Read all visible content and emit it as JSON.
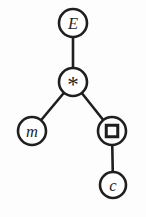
{
  "figure": {
    "background": "#fdfdfd",
    "stroke_color": "#1f1f1f",
    "node_fill": "#ffffff",
    "stroke_width": 2.6,
    "default_radius": 14,
    "width": 146,
    "height": 217,
    "nodes": [
      {
        "id": "E",
        "label": "E",
        "glyph": "letter",
        "x": 73,
        "y": 23
      },
      {
        "id": "star",
        "label": "*",
        "glyph": "asterisk",
        "x": 73,
        "y": 82
      },
      {
        "id": "m",
        "label": "m",
        "glyph": "letter",
        "x": 32,
        "y": 131
      },
      {
        "id": "box",
        "label": "",
        "glyph": "square",
        "icon": "square-icon",
        "x": 112,
        "y": 131,
        "square_size": 11.5,
        "square_stroke": 3
      },
      {
        "id": "c",
        "label": "c",
        "glyph": "letter",
        "x": 113,
        "y": 185,
        "r": 13
      }
    ],
    "edges": [
      {
        "from": "E",
        "to": "star"
      },
      {
        "from": "star",
        "to": "m"
      },
      {
        "from": "star",
        "to": "box"
      },
      {
        "from": "box",
        "to": "c"
      }
    ]
  }
}
